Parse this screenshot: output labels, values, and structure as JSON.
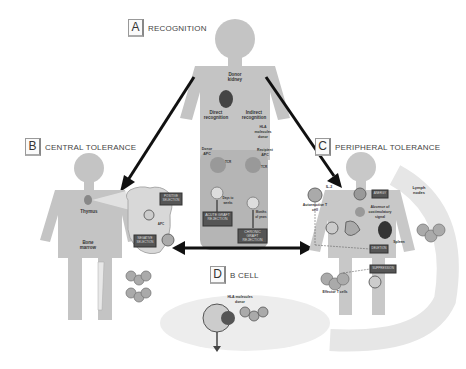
{
  "panels": {
    "A": {
      "letter": "A",
      "title": "RECOGNITION"
    },
    "B": {
      "letter": "B",
      "title": "CENTRAL TOLERANCE"
    },
    "C": {
      "letter": "C",
      "title": "PERIPHERAL TOLERANCE"
    },
    "D": {
      "letter": "D",
      "title": "B CELL"
    }
  },
  "recognition": {
    "donor_kidney": "Donor kidney",
    "direct": "Direct recognition",
    "indirect": "Indirect recognition",
    "hla_donor": "HLA molecules donor",
    "donor_apc": "Donor APC",
    "recipient_apc": "Recipient APC",
    "tcr1": "TCR",
    "tcr2": "TCR",
    "days1": "Days to weeks",
    "days2": "Months of years",
    "acute": "ACUTE GRAFT REJECTION",
    "chronic": "CHRONIC GRAFT REJECTION"
  },
  "central": {
    "thymus": "Thymus",
    "bone_marrow": "Bone marrow",
    "positive": "POSITIVE SELECTION",
    "negative": "NEGATIVE SELECTION",
    "apc": "APC"
  },
  "peripheral": {
    "il2": "IL-2",
    "autoreactive": "Autoreactive T cell",
    "lymph_nodes": "Lymph nodes",
    "absence": "Absence of costimulatory signal",
    "spleen": "Spleen",
    "anergy": "ANERGY",
    "deletion": "DELETION",
    "suppression": "SUPPRESSION",
    "effector": "Effector T cells"
  },
  "bcell": {
    "hla_donor": "HLA molecules donor"
  }
}
